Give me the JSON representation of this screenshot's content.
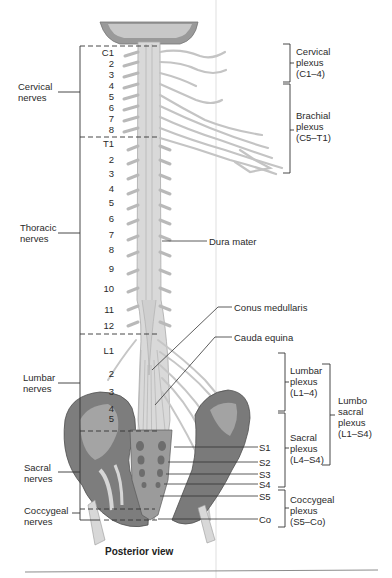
{
  "figure": {
    "caption": "Posterior view",
    "colors": {
      "background": "#ffffff",
      "nerve_tissue": "#d4d4d4",
      "nerve_outline": "#a8a8a8",
      "bone": "#8a8a8a",
      "bone_dark": "#5e5e5e",
      "label_text": "#2a2a2a",
      "leader_line": "#333333",
      "page_fold": "#e2e2e2"
    }
  },
  "left_groups": [
    {
      "id": "cervical",
      "label": "Cervical\nnerves"
    },
    {
      "id": "thoracic",
      "label": "Thoracic\nnerves"
    },
    {
      "id": "lumbar",
      "label": "Lumbar\nnerves"
    },
    {
      "id": "sacral",
      "label": "Sacral\nnerves"
    },
    {
      "id": "coccygeal",
      "label": "Coccygeal\nnerves"
    }
  ],
  "levels": {
    "cervical": [
      "C1",
      "2",
      "3",
      "4",
      "5",
      "6",
      "7",
      "8"
    ],
    "thoracic": [
      "T1",
      "2",
      "3",
      "4",
      "5",
      "6",
      "7",
      "8",
      "9",
      "10",
      "11",
      "12"
    ],
    "lumbar": [
      "L1",
      "2",
      "3",
      "4",
      "5"
    ]
  },
  "right_callouts": [
    {
      "id": "dura",
      "label": "Dura mater"
    },
    {
      "id": "conus",
      "label": "Conus medullaris"
    },
    {
      "id": "cauda",
      "label": "Cauda equina"
    }
  ],
  "sacral_levels": [
    "S1",
    "S2",
    "S3",
    "S4",
    "S5",
    "Co"
  ],
  "plexuses": [
    {
      "id": "cervical",
      "label": "Cervical\nplexus\n(C1–4)"
    },
    {
      "id": "brachial",
      "label": "Brachial\nplexus\n(C5–T1)"
    },
    {
      "id": "lumbar",
      "label": "Lumbar\nplexus\n(L1–4)"
    },
    {
      "id": "sacral",
      "label": "Sacral\nplexus\n(L4–S4)"
    },
    {
      "id": "lumbosacral",
      "label": "Lumbo\nsacral\nplexus\n(L1–S4)"
    },
    {
      "id": "coccygeal",
      "label": "Coccygeal\nplexus\n(S5–Co)"
    }
  ]
}
